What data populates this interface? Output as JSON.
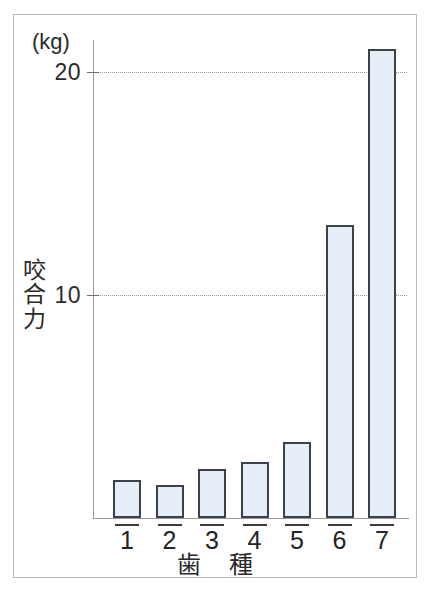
{
  "chart_data": {
    "type": "bar",
    "title": "",
    "subtitle": "",
    "xlabel": "歯　種",
    "ylabel": "咬合力",
    "unit_label": "(kg)",
    "categories": [
      "1",
      "2",
      "3",
      "4",
      "5",
      "6",
      "7"
    ],
    "values": [
      1.7,
      1.5,
      2.2,
      2.5,
      3.4,
      13.1,
      21.0
    ],
    "ylim": [
      0,
      21.4
    ],
    "yticks": [
      10,
      20
    ],
    "ytick_labels": [
      "10",
      "20"
    ],
    "grid": "horizontal-dotted",
    "legend": "none",
    "bar_fill_color": "#e6eff7",
    "bar_border_color": "#3b424b",
    "axis_color": "#9a9a9a",
    "gridline_color": "#9b9b9b",
    "frame_color": "#b9b9b9",
    "background_color": "#ffffff",
    "series": [
      {
        "name": "咬合力",
        "values": [
          1.7,
          1.5,
          2.2,
          2.5,
          3.4,
          13.1,
          21.0
        ]
      }
    ]
  },
  "axis": {
    "unit": "(kg)",
    "y_title": "咬合力",
    "x_title": "歯　種",
    "tick_20": "20",
    "tick_10": "10"
  },
  "x_ticks": [
    {
      "label": "1"
    },
    {
      "label": "2"
    },
    {
      "label": "3"
    },
    {
      "label": "4"
    },
    {
      "label": "5"
    },
    {
      "label": "6"
    },
    {
      "label": "7"
    }
  ]
}
